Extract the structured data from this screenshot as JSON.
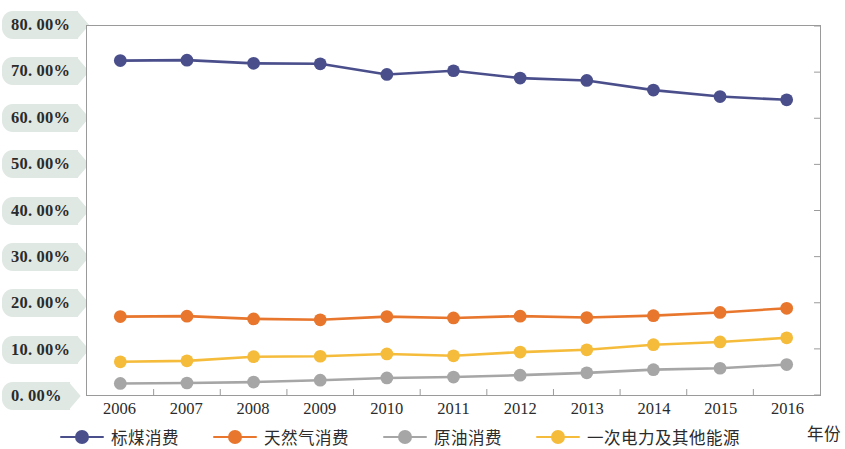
{
  "chart_data": {
    "type": "line",
    "title": "",
    "xlabel": "年份",
    "ylabel": "",
    "x": [
      "2006",
      "2007",
      "2008",
      "2009",
      "2010",
      "2011",
      "2012",
      "2013",
      "2014",
      "2015",
      "2016"
    ],
    "categories": [
      "2006",
      "2007",
      "2008",
      "2009",
      "2010",
      "2011",
      "2012",
      "2013",
      "2014",
      "2015",
      "2016"
    ],
    "ylim": [
      0,
      80
    ],
    "ytick_labels": [
      "0. 00%",
      "10. 00%",
      "20. 00%",
      "30. 00%",
      "40. 00%",
      "50. 00%",
      "60. 00%",
      "70. 00%",
      "80. 00%"
    ],
    "ytick_values": [
      0,
      10,
      20,
      30,
      40,
      50,
      60,
      70,
      80
    ],
    "grid": false,
    "legend_position": "bottom",
    "series": [
      {
        "name": "标煤消费",
        "color": "#4a4f8c",
        "values": [
          72.5,
          72.6,
          71.9,
          71.8,
          69.5,
          70.3,
          68.7,
          68.2,
          66.1,
          64.7,
          64.0
        ]
      },
      {
        "name": "天然气消费",
        "color": "#e8762c",
        "values": [
          17.0,
          17.1,
          16.5,
          16.3,
          17.0,
          16.7,
          17.1,
          16.8,
          17.2,
          17.9,
          18.8
        ]
      },
      {
        "name": "原油消费",
        "color": "#a6a6a6",
        "values": [
          2.5,
          2.6,
          2.8,
          3.2,
          3.7,
          3.9,
          4.3,
          4.8,
          5.5,
          5.8,
          6.6
        ]
      },
      {
        "name": "一次电力及其他能源",
        "color": "#f5bc3c",
        "values": [
          7.2,
          7.4,
          8.3,
          8.4,
          8.9,
          8.5,
          9.3,
          9.8,
          10.9,
          11.5,
          12.4
        ]
      }
    ]
  },
  "axis": {
    "x_title": "年份"
  },
  "legend": {
    "items": [
      {
        "label": "标煤消费",
        "color": "#4a4f8c"
      },
      {
        "label": "天然气消费",
        "color": "#e8762c"
      },
      {
        "label": "原油消费",
        "color": "#a6a6a6"
      },
      {
        "label": "一次电力及其他能源",
        "color": "#f5bc3c"
      }
    ]
  }
}
